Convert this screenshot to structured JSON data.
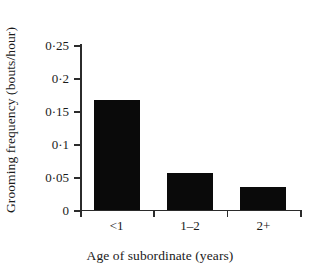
{
  "chart_data": {
    "type": "bar",
    "title": "",
    "xlabel": "Age of subordinate (years)",
    "ylabel": "Grooming frequency (bouts/hour)",
    "categories": [
      "<1",
      "1–2",
      "2+"
    ],
    "values": [
      0.167,
      0.056,
      0.035
    ],
    "series": [
      {
        "name": "Grooming frequency",
        "values": [
          0.167,
          0.056,
          0.035
        ]
      }
    ],
    "ylim": [
      0,
      0.25
    ],
    "ytick_values": [
      0,
      0.05,
      0.1,
      0.15,
      0.2,
      0.25
    ],
    "ytick_labels": [
      "0",
      "0·05",
      "0·1",
      "0·15",
      "0·2",
      "0·25"
    ],
    "grid": false,
    "legend": null,
    "legend_position": "none",
    "bar_color": "#0a0a0a",
    "axis_color": "#2b2b2b",
    "background_color": "#ffffff",
    "annotations": []
  }
}
